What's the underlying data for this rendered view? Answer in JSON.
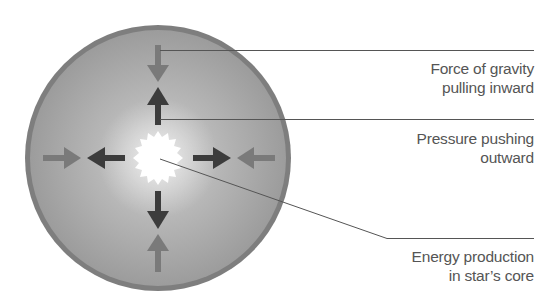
{
  "diagram": {
    "colors": {
      "star_fill_center": "#c8c8c8",
      "star_fill_edge": "#9a9a9a",
      "star_ring": "#7e7e7e",
      "core": "#ffffff",
      "gravity_arrow": "#7a7a7a",
      "pressure_arrow": "#3c3c3c",
      "leader_line": "#555555",
      "label_text": "#555555"
    },
    "labels": [
      {
        "id": "gravity",
        "lines": [
          "Force of gravity",
          "pulling inward"
        ]
      },
      {
        "id": "pressure",
        "lines": [
          "Pressure pushing",
          "outward"
        ]
      },
      {
        "id": "core",
        "lines": [
          "Energy production",
          "in star’s core"
        ]
      }
    ]
  }
}
